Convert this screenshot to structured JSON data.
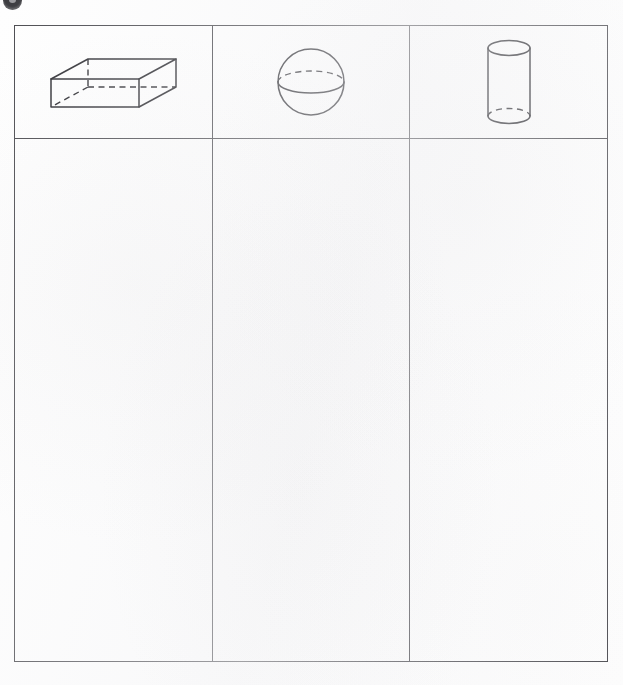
{
  "page": {
    "background_color": "#fefefe",
    "ink_color": "#2e2e33",
    "border_color": "#4b4b50"
  },
  "corner_mark": {
    "icon": "circle-mark-icon",
    "label": "",
    "color": "#3b3b3f"
  },
  "table": {
    "columns": 3,
    "rows": 2,
    "header_row_label": "",
    "header_cells": [
      {
        "shape": "rectangular-prism",
        "label": "",
        "hidden_edges": "dashed",
        "description": "rectangular prism drawn in oblique projection with dashed hidden edges"
      },
      {
        "shape": "sphere",
        "label": "",
        "hidden_edges": "dashed",
        "description": "sphere with equator ellipse, back half dashed and front half solid"
      },
      {
        "shape": "cylinder",
        "label": "",
        "hidden_edges": "dashed",
        "description": "upright cylinder with full top ellipse and dashed rear bottom arc"
      }
    ],
    "body_cells": [
      {
        "content": ""
      },
      {
        "content": ""
      },
      {
        "content": ""
      }
    ]
  }
}
